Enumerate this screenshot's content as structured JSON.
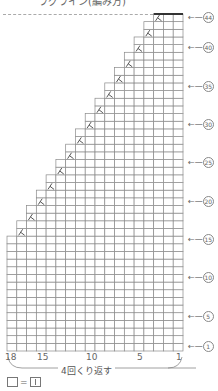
{
  "title": "ラグライン(編み方)",
  "chart_data": {
    "type": "table",
    "title": "ラグライン(編み方)",
    "columns": 18,
    "rows": 44,
    "full_width_rows": 15,
    "decrease_start_row": 16,
    "decrease_every_rows": 2,
    "decrease_symbol": "k2tog (人)",
    "top_row_width": 3,
    "column_labels": [
      "18",
      "15",
      "10",
      "5",
      "1"
    ],
    "row_labels": [
      "①",
      "⑤",
      "⑩",
      "⑮",
      "⑳",
      "㉕",
      "㉚",
      "㉟",
      "㊵",
      "㊹"
    ]
  },
  "labels": {
    "row_marks": [
      {
        "row": 44,
        "text": "44"
      },
      {
        "row": 40,
        "text": "40"
      },
      {
        "row": 35,
        "text": "35"
      },
      {
        "row": 30,
        "text": "30"
      },
      {
        "row": 25,
        "text": "25"
      },
      {
        "row": 20,
        "text": "20"
      },
      {
        "row": 15,
        "text": "15"
      },
      {
        "row": 10,
        "text": "10"
      },
      {
        "row": 5,
        "text": "5"
      },
      {
        "row": 1,
        "text": "1"
      }
    ],
    "col_18": "18",
    "col_15": "15",
    "col_10": "10",
    "col_5": "5",
    "col_1": "1",
    "repeat_text": "4回くり返す",
    "legend_equals": "="
  }
}
